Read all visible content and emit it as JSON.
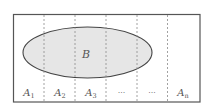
{
  "diagram": {
    "type": "set-partition-venn",
    "colors": {
      "border": "#555555",
      "divider": "#8a8a8a",
      "ellipse_fill": "#e6e6e6",
      "ellipse_stroke": "#444444",
      "text": "#555555",
      "background": "#ffffff"
    },
    "set_label": "B",
    "partitions": [
      {
        "base": "A",
        "sub": "1",
        "ellipsis": false
      },
      {
        "base": "A",
        "sub": "2",
        "ellipsis": false
      },
      {
        "base": "A",
        "sub": "3",
        "ellipsis": false
      },
      {
        "base": "",
        "sub": "",
        "ellipsis": true,
        "text": "···"
      },
      {
        "base": "",
        "sub": "",
        "ellipsis": true,
        "text": "···"
      },
      {
        "base": "A",
        "sub": "n",
        "ellipsis": false
      }
    ]
  }
}
